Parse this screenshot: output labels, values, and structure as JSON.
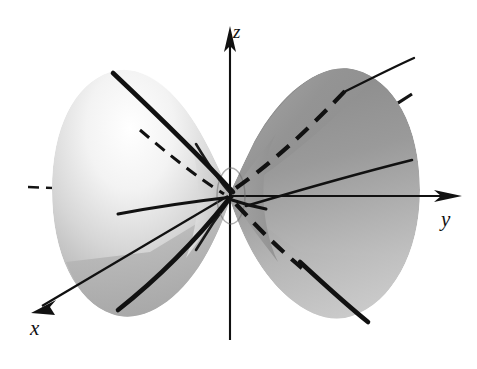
{
  "figure": {
    "kind": "3d-quadric-surface-plot",
    "surface_name": "hyperboloid-of-one-sheet",
    "background_color": "#ffffff",
    "ink_color": "#111111",
    "axes": [
      {
        "id": "x",
        "label": "x",
        "direction": "down-left",
        "arrowhead": "at-end",
        "style": "solid",
        "from": [
          230,
          196
        ],
        "to": [
          32,
          312
        ],
        "label_pos": [
          30,
          318
        ]
      },
      {
        "id": "y",
        "label": "y",
        "direction": "right",
        "arrowhead": "at-end",
        "style": "solid",
        "from": [
          230,
          196
        ],
        "to": [
          460,
          196
        ],
        "label_pos": [
          441,
          209
        ]
      },
      {
        "id": "z",
        "label": "z",
        "direction": "up",
        "arrowhead": "at-top",
        "style": "solid",
        "from": [
          230,
          340
        ],
        "to": [
          230,
          28
        ],
        "label_pos": [
          233,
          22
        ]
      },
      {
        "id": "y-negative",
        "label": "",
        "direction": "left",
        "arrowhead": "none",
        "style": "dashed",
        "from": [
          230,
          194
        ],
        "to": [
          28,
          187
        ],
        "label_pos": null
      }
    ],
    "palette": {
      "left_lobe_highlight": "#fdfdfd",
      "left_lobe_light": "#ededed",
      "left_lobe_mid": "#bdbdbd",
      "left_lobe_shadow": "#a2a2a2",
      "right_lobe_dark": "#8e8e8e",
      "right_lobe_mid": "#a6a6a6",
      "right_lobe_light": "#cfcfcf",
      "neck_light": "#e8e8e8",
      "neck_dark": "#9a9a9a",
      "line_solid": "#111111",
      "line_dashed": "#141414"
    },
    "ruling_lines": {
      "visible_label": "solid straight ruling lines (front of surface)",
      "hidden_label": "dashed straight ruling lines (behind surface)",
      "visible_count": 6,
      "hidden_count": 6
    },
    "caption": ""
  }
}
